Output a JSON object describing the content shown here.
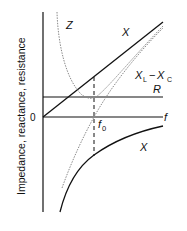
{
  "diagram": {
    "type": "series RLC resonance plot",
    "y_axis_label": "Impedance, reactance, resistance",
    "origin_label": "0",
    "x_axis_label": "f",
    "resonance_label": "f",
    "resonance_subscript": "0",
    "curves": [
      {
        "name": "Z",
        "label": "Z",
        "style": "dotted gray",
        "description": "Impedance magnitude, minimum at f0 equal to R"
      },
      {
        "name": "XL",
        "label": "X",
        "style": "solid black",
        "description": "Inductive reactance, straight line from origin"
      },
      {
        "name": "XC",
        "label": "X",
        "style": "solid black",
        "description": "Capacitive reactance, negative hyperbola"
      },
      {
        "name": "XL-XC",
        "label_main": "X",
        "label_sub1": "L",
        "label_dash": "−",
        "label_main2": "X",
        "label_sub2": "C",
        "style": "dotted gray",
        "description": "Net reactance, crosses zero at f0"
      },
      {
        "name": "R",
        "label": "R",
        "style": "solid black",
        "description": "Resistance, horizontal constant line"
      }
    ],
    "colors": {
      "solid": "#111111",
      "dotted": "#8a8a8a"
    }
  }
}
